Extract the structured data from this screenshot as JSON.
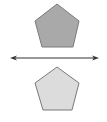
{
  "diagram": {
    "shapes": [
      {
        "name": "top-pentagon",
        "fill": "#a9a9a9",
        "stroke": "#7a7a7a"
      },
      {
        "name": "bottom-pentagon",
        "fill": "#dcdcdc",
        "stroke": "#7a7a7a"
      }
    ],
    "line": {
      "name": "line-of-reflection",
      "color": "#333333",
      "arrows": "both"
    }
  }
}
